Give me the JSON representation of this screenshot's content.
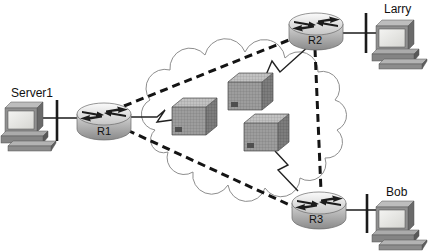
{
  "diagram": {
    "background": "#ffffff",
    "hosts": [
      {
        "id": "server1",
        "label": "Server1",
        "icon": "pc-icon"
      },
      {
        "id": "larry",
        "label": "Larry",
        "icon": "pc-icon"
      },
      {
        "id": "bob",
        "label": "Bob",
        "icon": "pc-icon"
      }
    ],
    "routers": [
      {
        "id": "r1",
        "label": "R1",
        "icon": "router-icon"
      },
      {
        "id": "r2",
        "label": "R2",
        "icon": "router-icon"
      },
      {
        "id": "r3",
        "label": "R3",
        "icon": "router-icon"
      }
    ],
    "cloud": {
      "name": "frame-relay-cloud",
      "switch_count": 3
    },
    "links": {
      "lan": [
        "Server1-R1",
        "Larry-R2",
        "Bob-R3"
      ],
      "serial_to_cloud": [
        "R1-cloud",
        "R2-cloud",
        "R3-cloud"
      ],
      "dashed_virtual_circuits": [
        "R1-R2",
        "R1-R3",
        "R2-R3"
      ]
    },
    "colors": {
      "line": "#1a1a1a",
      "dashed_line": "#141414",
      "cloud_stroke": "#8e8e8e",
      "cube_front": "#9d9d9d",
      "cube_top": "#c2c2c2",
      "cube_side": "#7d7d7d",
      "router_light": "#fbfbfb",
      "router_dark": "#8e8e8e",
      "screen": "#ececea",
      "label_text": "#111111"
    }
  }
}
